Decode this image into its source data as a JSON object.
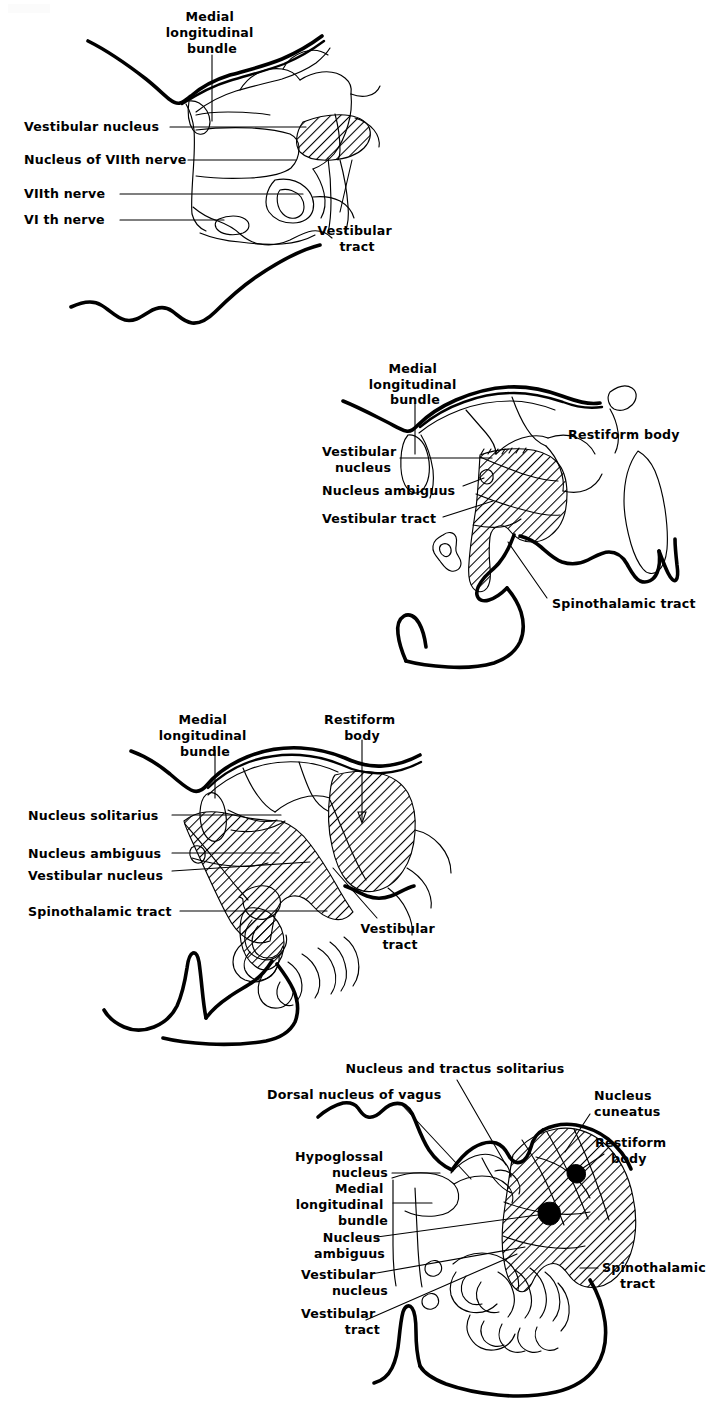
{
  "page": {
    "background_color": "#ffffff",
    "ink_color": "#000000",
    "width": 710,
    "height": 1401,
    "figure_count": 4
  },
  "figures": [
    {
      "id": "figure-1",
      "name": "pons-level-section",
      "level": "Pons (level of VIth and VIIth nerves)",
      "labels": [
        {
          "id": "f1-mlb",
          "text_lines": [
            "Medial",
            "longitudinal",
            "bundle"
          ],
          "align": "center"
        },
        {
          "id": "f1-vest-nucleus",
          "text_lines": [
            "Vestibular nucleus"
          ],
          "align": "right"
        },
        {
          "id": "f1-nuc-vii",
          "text_lines": [
            "Nucleus of VIIth nerve"
          ],
          "align": "right"
        },
        {
          "id": "f1-vii-nerve",
          "text_lines": [
            "VIIth  nerve"
          ],
          "align": "right"
        },
        {
          "id": "f1-vi-nerve",
          "text_lines": [
            "VI th  nerve"
          ],
          "align": "right"
        },
        {
          "id": "f1-vest-tract",
          "text_lines": [
            "Vestibular",
            "tract"
          ],
          "align": "center"
        }
      ]
    },
    {
      "id": "figure-2",
      "name": "upper-medulla-section",
      "level": "Upper medulla",
      "labels": [
        {
          "id": "f2-mlb",
          "text_lines": [
            "Medial",
            "longitudinal",
            "bundle"
          ],
          "align": "center"
        },
        {
          "id": "f2-vest-nucleus",
          "text_lines": [
            "Vestibular",
            "nucleus"
          ],
          "align": "right"
        },
        {
          "id": "f2-nuc-ambiguus",
          "text_lines": [
            "Nucleus  ambiguus"
          ],
          "align": "right"
        },
        {
          "id": "f2-vest-tract",
          "text_lines": [
            "Vestibular tract"
          ],
          "align": "right"
        },
        {
          "id": "f2-restiform",
          "text_lines": [
            "Restiform  body"
          ],
          "align": "left"
        },
        {
          "id": "f2-spinothalamic",
          "text_lines": [
            "Spinothalamic  tract"
          ],
          "align": "left"
        }
      ]
    },
    {
      "id": "figure-3",
      "name": "mid-medulla-section",
      "level": "Mid medulla",
      "labels": [
        {
          "id": "f3-mlb",
          "text_lines": [
            "Medial",
            "longitudinal",
            "bundle"
          ],
          "align": "center"
        },
        {
          "id": "f3-restiform",
          "text_lines": [
            "Restiform",
            "body"
          ],
          "align": "center"
        },
        {
          "id": "f3-nuc-solitarius",
          "text_lines": [
            "Nucleus  solitarius"
          ],
          "align": "right"
        },
        {
          "id": "f3-nuc-ambiguus",
          "text_lines": [
            "Nucleus  ambiguus"
          ],
          "align": "right"
        },
        {
          "id": "f3-vest-nucleus",
          "text_lines": [
            "Vestibular  nucleus"
          ],
          "align": "right"
        },
        {
          "id": "f3-spinothalamic",
          "text_lines": [
            "Spinothalamic  tract"
          ],
          "align": "right"
        },
        {
          "id": "f3-vest-tract",
          "text_lines": [
            "Vestibular",
            "tract"
          ],
          "align": "center"
        }
      ]
    },
    {
      "id": "figure-4",
      "name": "lower-medulla-section",
      "level": "Lower medulla",
      "labels": [
        {
          "id": "f4-nuc-tractus-solitarius",
          "text_lines": [
            "Nucleus and  tractus solitarius"
          ],
          "align": "center"
        },
        {
          "id": "f4-dorsal-vagus",
          "text_lines": [
            "Dorsal nucleus of vagus"
          ],
          "align": "left"
        },
        {
          "id": "f4-nuc-cuneatus",
          "text_lines": [
            "Nucleus",
            "cuneatus"
          ],
          "align": "left"
        },
        {
          "id": "f4-restiform",
          "text_lines": [
            "Restiform",
            "body"
          ],
          "align": "right"
        },
        {
          "id": "f4-hypoglossal",
          "text_lines": [
            "Hypoglossal",
            "nucleus"
          ],
          "align": "right"
        },
        {
          "id": "f4-mlb",
          "text_lines": [
            "Medial",
            "longitudinal",
            "bundle"
          ],
          "align": "right"
        },
        {
          "id": "f4-nuc-ambiguus",
          "text_lines": [
            "Nucleus",
            "ambiguus"
          ],
          "align": "right"
        },
        {
          "id": "f4-vest-nucleus",
          "text_lines": [
            "Vestibular",
            "nucleus"
          ],
          "align": "right"
        },
        {
          "id": "f4-vest-tract",
          "text_lines": [
            "Vestibular",
            "tract"
          ],
          "align": "right"
        },
        {
          "id": "f4-spinothalamic",
          "text_lines": [
            "Spinothalamic",
            "tract"
          ],
          "align": "left"
        }
      ]
    }
  ]
}
